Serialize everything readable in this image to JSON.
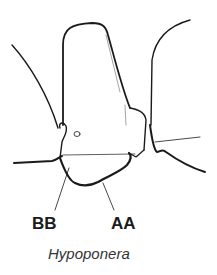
{
  "labels": {
    "bb": "BB",
    "aa": "AA"
  },
  "caption": "Hypoponera",
  "colors": {
    "line": "#1a1a1a",
    "background": "#ffffff"
  }
}
